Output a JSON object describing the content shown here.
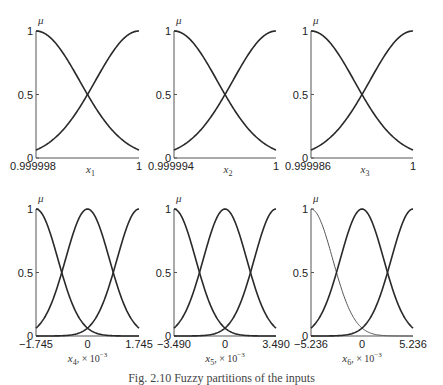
{
  "caption": "Fig. 2.10 Fuzzy partitions of the inputs",
  "chart_data": [
    {
      "type": "line",
      "title": "",
      "ylabel": "μ",
      "xlabel": "x1",
      "xlabel_sub": "1",
      "xlabel_scale": "",
      "xlim": [
        0.999998,
        1
      ],
      "ylim": [
        0,
        1
      ],
      "xticks": [
        "0.999998",
        "1"
      ],
      "yticks": [
        "0",
        "0.5",
        "1"
      ],
      "series": [
        {
          "name": "MF1",
          "shape": "gaussian",
          "center": "left",
          "values_at": {
            "left": 1,
            "mid": 0.5,
            "right": 0.0625
          }
        },
        {
          "name": "MF2",
          "shape": "gaussian",
          "center": "right",
          "values_at": {
            "left": 0.0625,
            "mid": 0.5,
            "right": 1
          }
        }
      ]
    },
    {
      "type": "line",
      "title": "",
      "ylabel": "μ",
      "xlabel": "x2",
      "xlabel_sub": "2",
      "xlabel_scale": "",
      "xlim": [
        0.999994,
        1
      ],
      "ylim": [
        0,
        1
      ],
      "xticks": [
        "0.999994",
        "1"
      ],
      "yticks": [
        "0",
        "0.5",
        "1"
      ],
      "series": [
        {
          "name": "MF1",
          "shape": "gaussian",
          "center": "left",
          "values_at": {
            "left": 1,
            "mid": 0.5,
            "right": 0.0625
          }
        },
        {
          "name": "MF2",
          "shape": "gaussian",
          "center": "right",
          "values_at": {
            "left": 0.0625,
            "mid": 0.5,
            "right": 1
          }
        }
      ]
    },
    {
      "type": "line",
      "title": "",
      "ylabel": "μ",
      "xlabel": "x3",
      "xlabel_sub": "3",
      "xlabel_scale": "",
      "xlim": [
        0.999986,
        1
      ],
      "ylim": [
        0,
        1
      ],
      "xticks": [
        "0.999986",
        "1"
      ],
      "yticks": [
        "0",
        "0.5",
        "1"
      ],
      "series": [
        {
          "name": "MF1",
          "shape": "gaussian",
          "center": "left",
          "values_at": {
            "left": 1,
            "mid": 0.5,
            "right": 0.0625
          }
        },
        {
          "name": "MF2",
          "shape": "gaussian",
          "center": "right",
          "values_at": {
            "left": 0.0625,
            "mid": 0.5,
            "right": 1
          }
        }
      ]
    },
    {
      "type": "line",
      "title": "",
      "ylabel": "μ",
      "xlabel": "x4, ×10^-3",
      "xlabel_sub": "4",
      "xlabel_scale": ", × 10",
      "xlim": [
        -1.745,
        1.745
      ],
      "ylim": [
        0,
        1
      ],
      "xticks": [
        "−1.745",
        "0",
        "1.745"
      ],
      "yticks": [
        "0",
        "0.5",
        "1"
      ],
      "series": [
        {
          "name": "MF1",
          "shape": "gaussian",
          "center": -1.745
        },
        {
          "name": "MF2",
          "shape": "gaussian",
          "center": 0
        },
        {
          "name": "MF3",
          "shape": "gaussian",
          "center": 1.745
        }
      ]
    },
    {
      "type": "line",
      "title": "",
      "ylabel": "μ",
      "xlabel": "x5, ×10^-3",
      "xlabel_sub": "5",
      "xlabel_scale": ", × 10",
      "xlim": [
        -3.49,
        3.49
      ],
      "ylim": [
        0,
        1
      ],
      "xticks": [
        "−3.490",
        "0",
        "3.490"
      ],
      "yticks": [
        "0",
        "0.5",
        "1"
      ],
      "series": [
        {
          "name": "MF1",
          "shape": "gaussian",
          "center": -3.49
        },
        {
          "name": "MF2",
          "shape": "gaussian",
          "center": 0
        },
        {
          "name": "MF3",
          "shape": "gaussian",
          "center": 3.49
        }
      ]
    },
    {
      "type": "line",
      "title": "",
      "ylabel": "μ",
      "xlabel": "x6, ×10^-3",
      "xlabel_sub": "6",
      "xlabel_scale": ", × 10",
      "xlim": [
        -5.236,
        5.236
      ],
      "ylim": [
        0,
        1
      ],
      "xticks": [
        "−5.236",
        "0",
        "5.236"
      ],
      "yticks": [
        "0",
        "0.5",
        "1"
      ],
      "series": [
        {
          "name": "MF1",
          "shape": "gaussian",
          "center": -5.236,
          "thin": true
        },
        {
          "name": "MF2",
          "shape": "gaussian",
          "center": 0
        },
        {
          "name": "MF3",
          "shape": "gaussian",
          "center": 5.236
        }
      ]
    }
  ],
  "labels": {
    "mu": "μ",
    "x": "x",
    "exp": "−3",
    "p1": {
      "xmin": "0.999998",
      "xmax": "1",
      "sub": "1"
    },
    "p2": {
      "xmin": "0.999994",
      "xmax": "1",
      "sub": "2"
    },
    "p3": {
      "xmin": "0.999986",
      "xmax": "1",
      "sub": "3"
    },
    "p4": {
      "xmin": "−1.745",
      "xmid": "0",
      "xmax": "1.745",
      "sub": "4",
      "scale": ", × 10"
    },
    "p5": {
      "xmin": "−3.490",
      "xmid": "0",
      "xmax": "3.490",
      "sub": "5",
      "scale": ", × 10"
    },
    "p6": {
      "xmin": "−5.236",
      "xmid": "0",
      "xmax": "5.236",
      "sub": "6",
      "scale": ", × 10"
    },
    "y0": "0",
    "y05": "0.5",
    "y1": "1"
  }
}
